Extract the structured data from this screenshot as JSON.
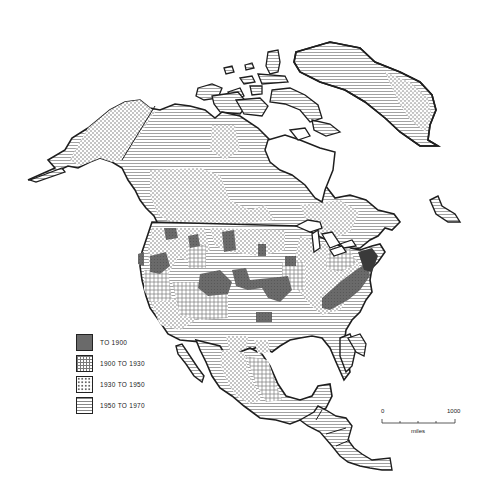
{
  "map": {
    "region": "North America",
    "colors": {
      "outline": "#1e1e1e",
      "to_1900": "#5a5a5a",
      "hatch": "#8a8a8a",
      "paper": "#ffffff"
    }
  },
  "legend": {
    "items": [
      {
        "label": "TO 1900",
        "pattern": "dark-solid"
      },
      {
        "label": "1900 TO 1930",
        "pattern": "grid"
      },
      {
        "label": "1930 TO 1950",
        "pattern": "dots"
      },
      {
        "label": "1950 TO 1970",
        "pattern": "horizontal-lines"
      }
    ]
  },
  "scale_bar": {
    "start": "0",
    "end": "1000",
    "unit": "miles"
  }
}
